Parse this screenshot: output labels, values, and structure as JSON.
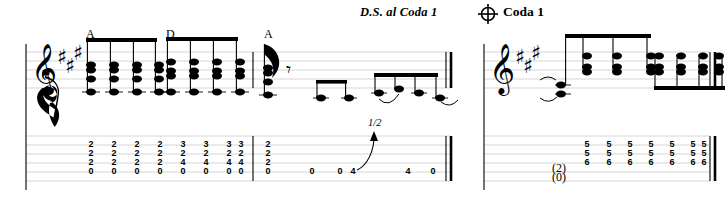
{
  "page": {
    "width": 727,
    "height": 204,
    "background": "#ffffff",
    "ink": "#000000",
    "staff_line_color": "#d8d8d8"
  },
  "directions": {
    "ds_al_coda": "D.S. al Coda 1",
    "coda_symbol": "coda-symbol",
    "coda_label": "Coda 1"
  },
  "systems": [
    {
      "id": "system-left",
      "clef": "treble-clef",
      "key_signature": {
        "name": "A major",
        "sharps": 3
      },
      "chord_symbols": [
        {
          "label": "A",
          "x": 88
        },
        {
          "label": "D",
          "x": 168
        },
        {
          "label": "A",
          "x": 266
        }
      ],
      "measures": [
        {
          "id": "measure-1",
          "beam_groups": [
            {
              "chord": "A",
              "count": 4,
              "stem": "up"
            },
            {
              "chord": "D",
              "count": 4,
              "stem": "up"
            }
          ],
          "tab_events": [
            {
              "type": "chord",
              "frets": [
                "2",
                "2",
                "2",
                "0"
              ]
            },
            {
              "type": "chord",
              "frets": [
                "2",
                "2",
                "2",
                "0"
              ]
            },
            {
              "type": "chord",
              "frets": [
                "2",
                "2",
                "2",
                "0"
              ]
            },
            {
              "type": "chord",
              "frets": [
                "2",
                "2",
                "2",
                "0"
              ]
            },
            {
              "type": "chord",
              "frets": [
                "3",
                "2",
                "4",
                "0"
              ]
            },
            {
              "type": "chord",
              "frets": [
                "3",
                "2",
                "4",
                "0"
              ]
            },
            {
              "type": "chord",
              "frets": [
                "3",
                "2",
                "4",
                "0"
              ]
            },
            {
              "type": "chord",
              "frets": [
                "3",
                "2",
                "4",
                "0"
              ]
            }
          ]
        },
        {
          "id": "measure-2",
          "rest": "eighth-rest",
          "tab_events": [
            {
              "type": "chord",
              "frets": [
                "2",
                "2",
                "2",
                "0"
              ]
            },
            {
              "type": "note",
              "fret": "0"
            },
            {
              "type": "note",
              "fret": "0"
            },
            {
              "type": "note",
              "fret": "4",
              "technique": "bend",
              "bend_amount": "1/2"
            },
            {
              "type": "note",
              "fret": "4"
            },
            {
              "type": "note",
              "fret": "0",
              "tied": true
            }
          ],
          "end_barline": "double"
        }
      ]
    },
    {
      "id": "system-right",
      "clef": "treble-clef",
      "key_signature": {
        "name": "A major",
        "sharps": 3
      },
      "measures": [
        {
          "id": "measure-3",
          "beam_groups": [
            {
              "count": 3,
              "stem": "up"
            },
            {
              "count": 4,
              "stem": "down"
            }
          ],
          "tab_events": [
            {
              "type": "chord",
              "frets": [
                "(2)",
                "(0)"
              ],
              "tied": true
            },
            {
              "type": "chord",
              "frets": [
                "5",
                "5",
                "6"
              ]
            },
            {
              "type": "chord",
              "frets": [
                "5",
                "5",
                "6"
              ]
            },
            {
              "type": "chord",
              "frets": [
                "5",
                "5",
                "6"
              ]
            },
            {
              "type": "chord",
              "frets": [
                "5",
                "5",
                "6"
              ]
            },
            {
              "type": "chord",
              "frets": [
                "5",
                "5",
                "6"
              ]
            },
            {
              "type": "chord",
              "frets": [
                "5",
                "5",
                "6"
              ]
            },
            {
              "type": "chord",
              "frets": [
                "5",
                "5",
                "6"
              ]
            }
          ],
          "end_barline": "double"
        }
      ]
    }
  ]
}
